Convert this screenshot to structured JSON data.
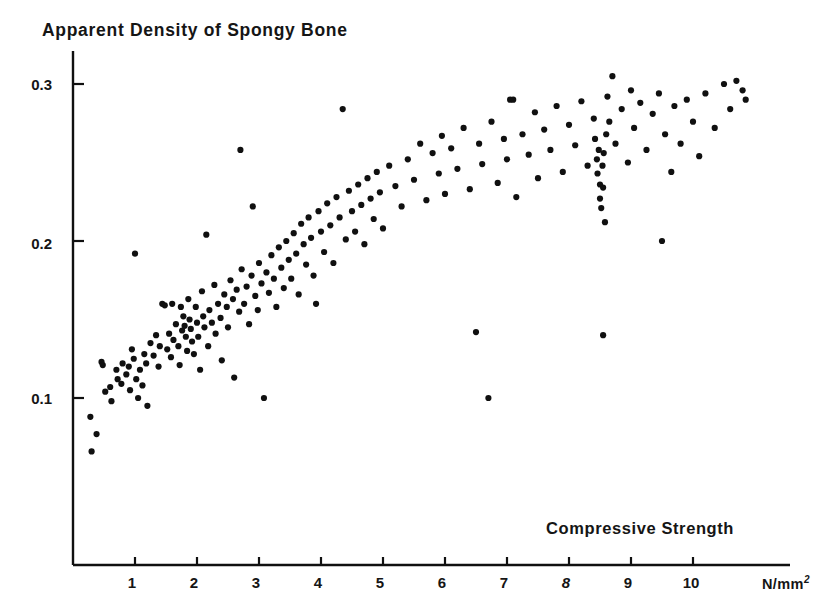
{
  "figure": {
    "title": "Apparent Density of Spongy Bone",
    "xaxis_title": "Compressive Strength",
    "unit_text": "N/mm",
    "unit_exponent": "2"
  },
  "chart_data": {
    "type": "scatter",
    "title": "Apparent Density of Spongy Bone",
    "xlabel": "Compressive Strength (N/mm2)",
    "ylabel": "Apparent Density of Spongy Bone",
    "xlim": [
      0,
      11.4
    ],
    "ylim": [
      0,
      0.325
    ],
    "xticks": [
      1,
      2,
      3,
      4,
      5,
      6,
      7,
      8,
      9,
      10
    ],
    "xtick_labels": [
      "1",
      "2",
      "3",
      "4",
      "5",
      "6",
      "7",
      "8",
      "9",
      "10"
    ],
    "yticks": [
      0.1,
      0.2,
      0.3
    ],
    "ytick_labels": [
      "0.1",
      "0.2",
      "0.3"
    ],
    "grid": false,
    "legend": null,
    "marker": "dot",
    "marker_color": "#101010",
    "marker_size": 3.1,
    "n_points": 205,
    "points": [
      [
        0.28,
        0.088
      ],
      [
        0.3,
        0.066
      ],
      [
        0.38,
        0.077
      ],
      [
        0.46,
        0.123
      ],
      [
        0.48,
        0.121
      ],
      [
        0.52,
        0.104
      ],
      [
        0.6,
        0.107
      ],
      [
        0.62,
        0.098
      ],
      [
        0.7,
        0.118
      ],
      [
        0.72,
        0.112
      ],
      [
        0.78,
        0.109
      ],
      [
        0.8,
        0.122
      ],
      [
        0.86,
        0.115
      ],
      [
        0.9,
        0.12
      ],
      [
        0.92,
        0.105
      ],
      [
        0.95,
        0.131
      ],
      [
        0.98,
        0.125
      ],
      [
        1.0,
        0.192
      ],
      [
        1.02,
        0.112
      ],
      [
        1.05,
        0.1
      ],
      [
        1.08,
        0.118
      ],
      [
        1.12,
        0.108
      ],
      [
        1.15,
        0.128
      ],
      [
        1.18,
        0.122
      ],
      [
        1.2,
        0.095
      ],
      [
        1.25,
        0.135
      ],
      [
        1.3,
        0.127
      ],
      [
        1.34,
        0.14
      ],
      [
        1.38,
        0.12
      ],
      [
        1.4,
        0.133
      ],
      [
        1.44,
        0.16
      ],
      [
        1.48,
        0.159
      ],
      [
        1.52,
        0.131
      ],
      [
        1.55,
        0.141
      ],
      [
        1.58,
        0.126
      ],
      [
        1.6,
        0.16
      ],
      [
        1.62,
        0.137
      ],
      [
        1.66,
        0.147
      ],
      [
        1.7,
        0.133
      ],
      [
        1.72,
        0.121
      ],
      [
        1.74,
        0.158
      ],
      [
        1.76,
        0.143
      ],
      [
        1.78,
        0.152
      ],
      [
        1.8,
        0.146
      ],
      [
        1.82,
        0.139
      ],
      [
        1.84,
        0.13
      ],
      [
        1.86,
        0.163
      ],
      [
        1.88,
        0.15
      ],
      [
        1.9,
        0.144
      ],
      [
        1.92,
        0.136
      ],
      [
        1.95,
        0.128
      ],
      [
        1.98,
        0.158
      ],
      [
        2.0,
        0.148
      ],
      [
        2.02,
        0.139
      ],
      [
        2.05,
        0.118
      ],
      [
        2.08,
        0.168
      ],
      [
        2.1,
        0.152
      ],
      [
        2.12,
        0.145
      ],
      [
        2.15,
        0.204
      ],
      [
        2.18,
        0.133
      ],
      [
        2.2,
        0.156
      ],
      [
        2.24,
        0.148
      ],
      [
        2.28,
        0.172
      ],
      [
        2.3,
        0.141
      ],
      [
        2.34,
        0.16
      ],
      [
        2.38,
        0.151
      ],
      [
        2.4,
        0.124
      ],
      [
        2.44,
        0.166
      ],
      [
        2.48,
        0.158
      ],
      [
        2.5,
        0.145
      ],
      [
        2.54,
        0.175
      ],
      [
        2.58,
        0.163
      ],
      [
        2.6,
        0.113
      ],
      [
        2.64,
        0.169
      ],
      [
        2.68,
        0.155
      ],
      [
        2.7,
        0.258
      ],
      [
        2.72,
        0.182
      ],
      [
        2.76,
        0.16
      ],
      [
        2.8,
        0.171
      ],
      [
        2.84,
        0.147
      ],
      [
        2.88,
        0.178
      ],
      [
        2.9,
        0.222
      ],
      [
        2.94,
        0.165
      ],
      [
        2.98,
        0.156
      ],
      [
        3.0,
        0.186
      ],
      [
        3.04,
        0.173
      ],
      [
        3.08,
        0.1
      ],
      [
        3.12,
        0.18
      ],
      [
        3.16,
        0.167
      ],
      [
        3.2,
        0.191
      ],
      [
        3.24,
        0.176
      ],
      [
        3.28,
        0.158
      ],
      [
        3.32,
        0.196
      ],
      [
        3.36,
        0.183
      ],
      [
        3.4,
        0.17
      ],
      [
        3.44,
        0.2
      ],
      [
        3.48,
        0.188
      ],
      [
        3.52,
        0.176
      ],
      [
        3.56,
        0.205
      ],
      [
        3.6,
        0.192
      ],
      [
        3.64,
        0.166
      ],
      [
        3.68,
        0.211
      ],
      [
        3.72,
        0.198
      ],
      [
        3.76,
        0.185
      ],
      [
        3.8,
        0.215
      ],
      [
        3.84,
        0.202
      ],
      [
        3.88,
        0.178
      ],
      [
        3.92,
        0.16
      ],
      [
        3.96,
        0.219
      ],
      [
        4.0,
        0.206
      ],
      [
        4.05,
        0.193
      ],
      [
        4.1,
        0.224
      ],
      [
        4.15,
        0.21
      ],
      [
        4.2,
        0.186
      ],
      [
        4.25,
        0.228
      ],
      [
        4.3,
        0.215
      ],
      [
        4.35,
        0.284
      ],
      [
        4.4,
        0.201
      ],
      [
        4.45,
        0.232
      ],
      [
        4.5,
        0.219
      ],
      [
        4.55,
        0.206
      ],
      [
        4.6,
        0.236
      ],
      [
        4.65,
        0.223
      ],
      [
        4.7,
        0.198
      ],
      [
        4.75,
        0.24
      ],
      [
        4.8,
        0.227
      ],
      [
        4.85,
        0.214
      ],
      [
        4.9,
        0.244
      ],
      [
        4.95,
        0.231
      ],
      [
        5.0,
        0.208
      ],
      [
        5.1,
        0.248
      ],
      [
        5.2,
        0.235
      ],
      [
        5.3,
        0.222
      ],
      [
        5.4,
        0.252
      ],
      [
        5.5,
        0.239
      ],
      [
        5.6,
        0.262
      ],
      [
        5.7,
        0.226
      ],
      [
        5.8,
        0.256
      ],
      [
        5.9,
        0.243
      ],
      [
        5.95,
        0.267
      ],
      [
        6.0,
        0.23
      ],
      [
        6.1,
        0.259
      ],
      [
        6.2,
        0.246
      ],
      [
        6.3,
        0.272
      ],
      [
        6.4,
        0.233
      ],
      [
        6.5,
        0.142
      ],
      [
        6.55,
        0.262
      ],
      [
        6.6,
        0.249
      ],
      [
        6.7,
        0.1
      ],
      [
        6.75,
        0.276
      ],
      [
        6.85,
        0.237
      ],
      [
        6.95,
        0.265
      ],
      [
        7.0,
        0.252
      ],
      [
        7.05,
        0.29
      ],
      [
        7.1,
        0.29
      ],
      [
        7.15,
        0.228
      ],
      [
        7.25,
        0.268
      ],
      [
        7.35,
        0.255
      ],
      [
        7.45,
        0.282
      ],
      [
        7.5,
        0.24
      ],
      [
        7.6,
        0.271
      ],
      [
        7.7,
        0.258
      ],
      [
        7.8,
        0.286
      ],
      [
        7.9,
        0.244
      ],
      [
        8.0,
        0.274
      ],
      [
        8.1,
        0.261
      ],
      [
        8.2,
        0.289
      ],
      [
        8.3,
        0.248
      ],
      [
        8.4,
        0.278
      ],
      [
        8.42,
        0.265
      ],
      [
        8.45,
        0.252
      ],
      [
        8.46,
        0.243
      ],
      [
        8.48,
        0.258
      ],
      [
        8.5,
        0.236
      ],
      [
        8.5,
        0.227
      ],
      [
        8.52,
        0.221
      ],
      [
        8.54,
        0.248
      ],
      [
        8.55,
        0.234
      ],
      [
        8.56,
        0.256
      ],
      [
        8.58,
        0.212
      ],
      [
        8.55,
        0.14
      ],
      [
        8.6,
        0.268
      ],
      [
        8.62,
        0.292
      ],
      [
        8.65,
        0.276
      ],
      [
        8.7,
        0.305
      ],
      [
        8.75,
        0.262
      ],
      [
        8.85,
        0.284
      ],
      [
        8.95,
        0.25
      ],
      [
        9.0,
        0.296
      ],
      [
        9.05,
        0.272
      ],
      [
        9.15,
        0.288
      ],
      [
        9.25,
        0.258
      ],
      [
        9.35,
        0.281
      ],
      [
        9.45,
        0.294
      ],
      [
        9.5,
        0.2
      ],
      [
        9.55,
        0.268
      ],
      [
        9.65,
        0.244
      ],
      [
        9.7,
        0.286
      ],
      [
        9.8,
        0.262
      ],
      [
        9.9,
        0.29
      ],
      [
        10.0,
        0.276
      ],
      [
        10.1,
        0.254
      ],
      [
        10.2,
        0.294
      ],
      [
        10.35,
        0.272
      ],
      [
        10.5,
        0.3
      ],
      [
        10.6,
        0.284
      ],
      [
        10.7,
        0.302
      ],
      [
        10.8,
        0.296
      ],
      [
        10.85,
        0.29
      ]
    ]
  },
  "axes": {
    "ytick_labels": [
      "0.3",
      "0.2",
      "0.1"
    ],
    "xtick_labels": [
      "1",
      "2",
      "3",
      "4",
      "5",
      "6",
      "7",
      "8",
      "9",
      "10"
    ]
  }
}
